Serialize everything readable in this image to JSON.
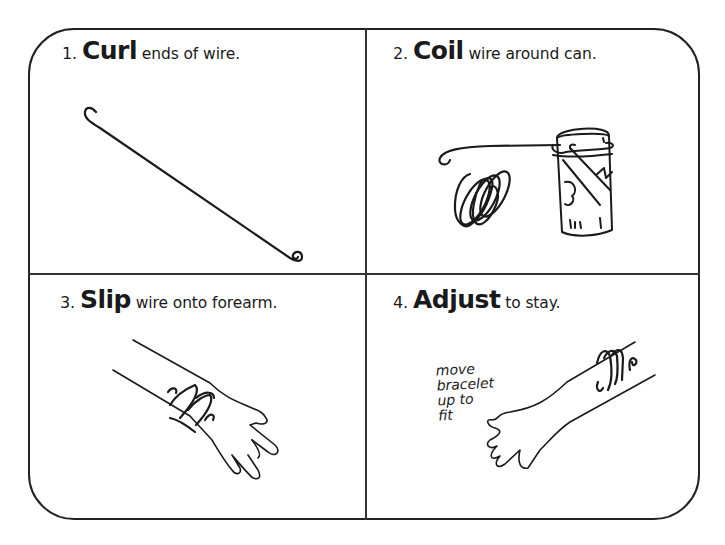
{
  "steps": [
    {
      "number": "1.",
      "verb": "Curl",
      "rest": "ends of wire."
    },
    {
      "number": "2.",
      "verb": "Coil",
      "rest": "wire around can."
    },
    {
      "number": "3.",
      "verb": "Slip",
      "rest": "wire onto forearm."
    },
    {
      "number": "4.",
      "verb": "Adjust",
      "rest": "to stay."
    }
  ],
  "note": {
    "lines": [
      "move",
      "bracelet",
      "up to",
      "fit"
    ]
  },
  "colors": {
    "ink": "#1a1a1a",
    "background": "#ffffff"
  }
}
